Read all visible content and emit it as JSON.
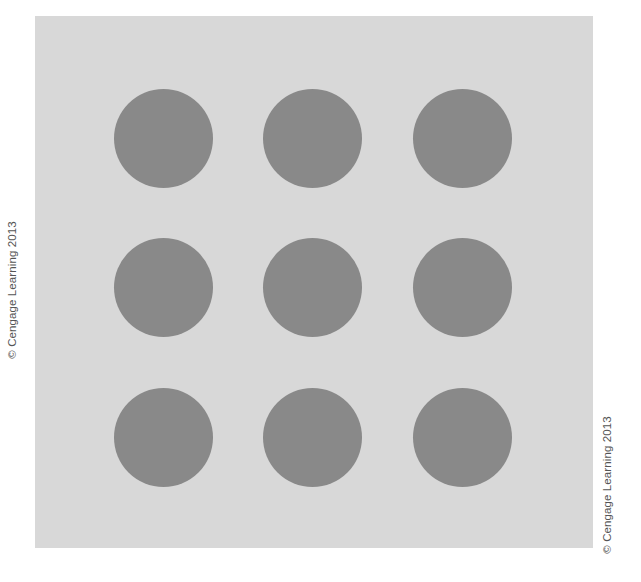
{
  "figure": {
    "background_color": "#d8d8d8",
    "dot_color": "#898989",
    "grid": {
      "rows": 3,
      "columns": 3
    },
    "dots": [
      {
        "row": 1,
        "col": 1
      },
      {
        "row": 1,
        "col": 2
      },
      {
        "row": 1,
        "col": 3
      },
      {
        "row": 2,
        "col": 1
      },
      {
        "row": 2,
        "col": 2
      },
      {
        "row": 2,
        "col": 3
      },
      {
        "row": 3,
        "col": 1
      },
      {
        "row": 3,
        "col": 2
      },
      {
        "row": 3,
        "col": 3
      }
    ]
  },
  "credits": {
    "left": "© Cengage Learning 2013",
    "right": "© Cengage Learning 2013"
  }
}
